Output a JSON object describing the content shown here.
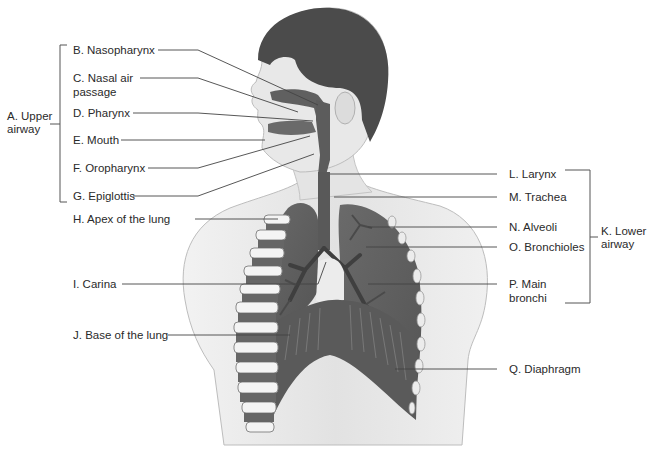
{
  "diagram": {
    "groups": [
      {
        "id": "A",
        "label": "A. Upper",
        "label2": "airway"
      },
      {
        "id": "K",
        "label": "K. Lower",
        "label2": "airway"
      }
    ],
    "labels": {
      "B": "B. Nasopharynx",
      "C1": "C. Nasal air",
      "C2": "passage",
      "D": "D. Pharynx",
      "E": "E. Mouth",
      "F": "F. Oropharynx",
      "G": "G. Epiglottis",
      "H": "H. Apex of the lung",
      "I": "I. Carina",
      "J": "J. Base of the lung",
      "L": "L. Larynx",
      "M": "M. Trachea",
      "N": "N. Alveoli",
      "O": "O. Bronchioles",
      "P1": "P. Main",
      "P2": "bronchi",
      "Q": "Q. Diaphragm"
    },
    "colors": {
      "organ": "#5f5f5f",
      "skin": "#e6e6e6",
      "hair": "#4a4a4a",
      "leader": "#444444"
    }
  }
}
